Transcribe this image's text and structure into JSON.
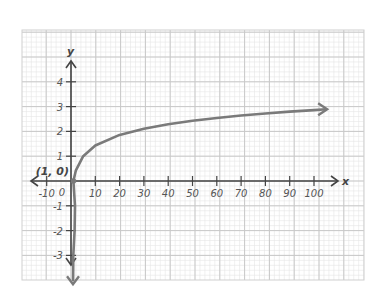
{
  "chart_data": {
    "type": "line",
    "title": "",
    "function": "y = log_5(x)",
    "xlabel": "x",
    "ylabel": "y",
    "xlim": [
      -15,
      110
    ],
    "ylim": [
      -4,
      5
    ],
    "grid": true,
    "x_ticks": [
      -10,
      10,
      20,
      30,
      40,
      50,
      60,
      70,
      80,
      90,
      100
    ],
    "x_tick_labels": [
      "-10",
      "10",
      "20",
      "30",
      "40",
      "50",
      "60",
      "70",
      "80",
      "90",
      "100"
    ],
    "y_ticks": [
      4,
      3,
      2,
      1,
      -1,
      -2,
      -3
    ],
    "y_tick_labels": [
      "4",
      "3",
      "2",
      "1",
      "-1",
      "-2",
      "-3"
    ],
    "origin_label": "0",
    "annotations": [
      {
        "text": "(1, 0)",
        "x": 1,
        "y": 0
      }
    ],
    "series": [
      {
        "name": "log curve",
        "x": [
          0.0016,
          0.008,
          0.04,
          0.2,
          1,
          2,
          5,
          10,
          20,
          30,
          40,
          50,
          60,
          70,
          80,
          90,
          100,
          105
        ],
        "values": [
          -4,
          -3,
          -2,
          -1,
          0,
          0.43,
          1,
          1.43,
          1.86,
          2.11,
          2.29,
          2.43,
          2.54,
          2.64,
          2.72,
          2.8,
          2.86,
          2.89
        ]
      }
    ],
    "colors": {
      "curve": "#7a7a7a",
      "axes": "#444444",
      "grid_major": "#c8c8c8",
      "grid_minor": "#e6e6e6"
    }
  }
}
